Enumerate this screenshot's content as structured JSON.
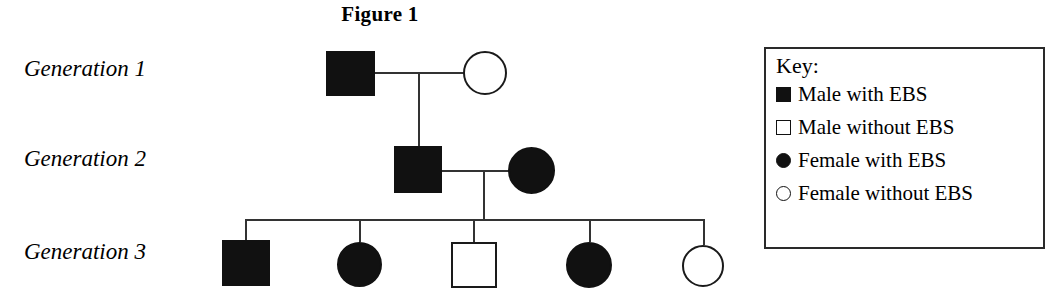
{
  "figure": {
    "title": "Figure 1",
    "type": "pedigree-chart",
    "condition_abbreviation": "EBS"
  },
  "generations": [
    {
      "label": "Generation 1"
    },
    {
      "label": "Generation 2"
    },
    {
      "label": "Generation 3"
    }
  ],
  "key": {
    "title": "Key:",
    "entries": [
      {
        "shape": "square",
        "fill": "filled",
        "label": "Male with EBS"
      },
      {
        "shape": "square",
        "fill": "open",
        "label": "Male without EBS"
      },
      {
        "shape": "circle",
        "fill": "filled",
        "label": "Female with EBS"
      },
      {
        "shape": "circle",
        "fill": "open",
        "label": "Female without EBS"
      }
    ]
  },
  "individuals": [
    {
      "id": "I-1",
      "generation": 1,
      "sex": "male",
      "affected": true,
      "symbol": "filled-square",
      "name": "generation1-father"
    },
    {
      "id": "I-2",
      "generation": 1,
      "sex": "female",
      "affected": false,
      "symbol": "open-circle",
      "name": "generation1-mother"
    },
    {
      "id": "II-1",
      "generation": 2,
      "sex": "male",
      "affected": true,
      "symbol": "filled-square",
      "name": "generation2-father"
    },
    {
      "id": "II-2",
      "generation": 2,
      "sex": "female",
      "affected": true,
      "symbol": "filled-circle",
      "name": "generation2-mother"
    },
    {
      "id": "III-1",
      "generation": 3,
      "sex": "male",
      "affected": true,
      "symbol": "filled-square",
      "name": "generation3-child-1"
    },
    {
      "id": "III-2",
      "generation": 3,
      "sex": "female",
      "affected": true,
      "symbol": "filled-circle",
      "name": "generation3-child-2"
    },
    {
      "id": "III-3",
      "generation": 3,
      "sex": "male",
      "affected": false,
      "symbol": "open-square",
      "name": "generation3-child-3"
    },
    {
      "id": "III-4",
      "generation": 3,
      "sex": "female",
      "affected": true,
      "symbol": "filled-circle",
      "name": "generation3-child-4"
    },
    {
      "id": "III-5",
      "generation": 3,
      "sex": "female",
      "affected": false,
      "symbol": "open-circle",
      "name": "generation3-child-5"
    }
  ],
  "colors": {
    "affected_fill": "#111111",
    "unaffected_fill": "#ffffff",
    "stroke": "#1a1a1a",
    "line": "#333333",
    "background": "#ffffff"
  }
}
